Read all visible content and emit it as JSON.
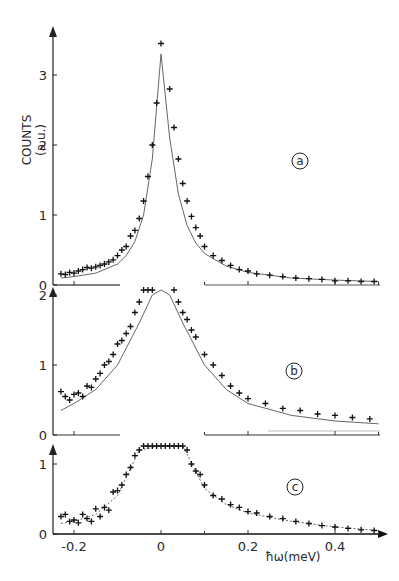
{
  "chart_data": {
    "type": "scatter",
    "title": "",
    "xlabel": "ħω(meV)",
    "ylabel": "COUNTS (a.u.)",
    "xlim": [
      -0.24,
      0.5
    ],
    "x_ticks": [
      "-0.2",
      "0",
      "0.2",
      "0.4"
    ],
    "x_tick_values": [
      -0.2,
      0,
      0.2,
      0.4
    ],
    "panels": [
      {
        "label": "a",
        "ylim": [
          0,
          3.5
        ],
        "y_ticks": [
          "0",
          "1",
          "2",
          "3"
        ],
        "y_tick_values": [
          0,
          1,
          2,
          3
        ],
        "series": [
          {
            "name": "data",
            "style": "plus-markers",
            "x": [
              -0.23,
              -0.22,
              -0.21,
              -0.2,
              -0.19,
              -0.18,
              -0.17,
              -0.16,
              -0.15,
              -0.14,
              -0.13,
              -0.12,
              -0.11,
              -0.1,
              -0.09,
              -0.08,
              -0.07,
              -0.06,
              -0.05,
              -0.04,
              -0.03,
              -0.02,
              -0.01,
              0.0,
              0.02,
              0.03,
              0.04,
              0.05,
              0.06,
              0.07,
              0.08,
              0.09,
              0.1,
              0.12,
              0.14,
              0.16,
              0.18,
              0.2,
              0.22,
              0.25,
              0.28,
              0.31,
              0.34,
              0.37,
              0.4,
              0.43,
              0.46,
              0.49
            ],
            "y": [
              0.16,
              0.15,
              0.18,
              0.17,
              0.2,
              0.22,
              0.25,
              0.24,
              0.26,
              0.28,
              0.3,
              0.33,
              0.36,
              0.42,
              0.5,
              0.55,
              0.7,
              0.78,
              0.95,
              1.2,
              1.55,
              2.0,
              2.6,
              3.45,
              2.8,
              2.25,
              1.8,
              1.45,
              1.2,
              0.98,
              0.82,
              0.7,
              0.55,
              0.42,
              0.35,
              0.28,
              0.22,
              0.2,
              0.16,
              0.14,
              0.12,
              0.1,
              0.09,
              0.08,
              0.06,
              0.06,
              0.05,
              0.05
            ]
          },
          {
            "name": "fit",
            "style": "solid-line",
            "x": [
              -0.23,
              -0.2,
              -0.15,
              -0.1,
              -0.08,
              -0.06,
              -0.04,
              -0.02,
              0.0,
              0.02,
              0.04,
              0.06,
              0.08,
              0.1,
              0.15,
              0.2,
              0.3,
              0.4,
              0.5
            ],
            "y": [
              0.1,
              0.12,
              0.17,
              0.3,
              0.42,
              0.62,
              1.0,
              1.8,
              3.3,
              2.1,
              1.3,
              0.85,
              0.6,
              0.45,
              0.27,
              0.18,
              0.1,
              0.07,
              0.05
            ]
          }
        ]
      },
      {
        "label": "b",
        "ylim": [
          0,
          2
        ],
        "y_ticks": [
          "0",
          "1",
          "2"
        ],
        "y_tick_values": [
          0,
          1,
          2
        ],
        "series": [
          {
            "name": "data",
            "style": "plus-markers",
            "x": [
              -0.23,
              -0.22,
              -0.21,
              -0.2,
              -0.19,
              -0.18,
              -0.17,
              -0.16,
              -0.15,
              -0.14,
              -0.13,
              -0.12,
              -0.11,
              -0.1,
              -0.09,
              -0.08,
              -0.07,
              -0.06,
              -0.05,
              -0.04,
              -0.03,
              -0.02,
              0.03,
              0.04,
              0.05,
              0.06,
              0.07,
              0.08,
              0.1,
              0.12,
              0.14,
              0.16,
              0.18,
              0.2,
              0.24,
              0.28,
              0.32,
              0.36,
              0.4,
              0.44,
              0.48
            ],
            "y": [
              0.62,
              0.55,
              0.5,
              0.58,
              0.6,
              0.55,
              0.7,
              0.68,
              0.8,
              0.88,
              1.0,
              1.05,
              1.15,
              1.3,
              1.35,
              1.45,
              1.55,
              1.75,
              1.9,
              2.2,
              2.4,
              2.5,
              2.1,
              1.9,
              1.75,
              1.65,
              1.5,
              1.4,
              1.15,
              1.0,
              0.85,
              0.7,
              0.6,
              0.52,
              0.45,
              0.38,
              0.35,
              0.3,
              0.28,
              0.25,
              0.23
            ]
          },
          {
            "name": "fit",
            "style": "solid-line",
            "x": [
              -0.23,
              -0.2,
              -0.15,
              -0.1,
              -0.05,
              -0.02,
              0.0,
              0.02,
              0.05,
              0.1,
              0.15,
              0.2,
              0.3,
              0.4,
              0.5
            ],
            "y": [
              0.35,
              0.45,
              0.65,
              1.0,
              1.6,
              2.0,
              2.1,
              2.0,
              1.6,
              1.0,
              0.65,
              0.45,
              0.28,
              0.2,
              0.16
            ]
          }
        ]
      },
      {
        "label": "c",
        "ylim": [
          0,
          1.3
        ],
        "y_ticks": [
          "0",
          "1"
        ],
        "y_tick_values": [
          0,
          1
        ],
        "series": [
          {
            "name": "data",
            "style": "plus-markers",
            "x": [
              -0.23,
              -0.22,
              -0.21,
              -0.2,
              -0.19,
              -0.18,
              -0.17,
              -0.16,
              -0.15,
              -0.14,
              -0.13,
              -0.12,
              -0.11,
              -0.1,
              -0.09,
              -0.08,
              -0.07,
              -0.06,
              -0.05,
              -0.04,
              -0.03,
              -0.02,
              -0.01,
              0.0,
              0.01,
              0.02,
              0.03,
              0.04,
              0.05,
              0.06,
              0.07,
              0.08,
              0.09,
              0.1,
              0.12,
              0.14,
              0.16,
              0.18,
              0.2,
              0.22,
              0.25,
              0.28,
              0.31,
              0.34,
              0.37,
              0.4,
              0.43,
              0.46,
              0.49
            ],
            "y": [
              0.25,
              0.28,
              0.18,
              0.2,
              0.16,
              0.28,
              0.22,
              0.18,
              0.36,
              0.25,
              0.38,
              0.34,
              0.6,
              0.62,
              0.7,
              0.85,
              0.95,
              1.12,
              1.2,
              1.5,
              1.75,
              1.95,
              2.2,
              2.3,
              2.1,
              1.9,
              1.75,
              1.6,
              1.4,
              1.2,
              1.0,
              0.9,
              0.85,
              0.7,
              0.55,
              0.5,
              0.42,
              0.38,
              0.32,
              0.3,
              0.25,
              0.22,
              0.18,
              0.15,
              0.12,
              0.1,
              0.08,
              0.06,
              0.05
            ]
          },
          {
            "name": "fit",
            "style": "dotted-line",
            "x": [
              -0.23,
              -0.2,
              -0.15,
              -0.1,
              -0.05,
              0.0,
              0.05,
              0.1,
              0.15,
              0.2,
              0.3,
              0.4,
              0.5
            ],
            "y": [
              0.15,
              0.18,
              0.28,
              0.55,
              1.2,
              2.2,
              1.3,
              0.65,
              0.42,
              0.3,
              0.18,
              0.1,
              0.05
            ]
          }
        ]
      }
    ],
    "legend": [],
    "annotations": [
      "a",
      "b",
      "c"
    ],
    "grid": false
  },
  "figure": {
    "y_axis_title_line1": "COUNTS",
    "y_axis_title_line2": "(a.u.)",
    "x_axis_title": "ħω(meV)",
    "panel_a_label": "a",
    "panel_b_label": "b",
    "panel_c_label": "c",
    "x_tick_labels": [
      "-0.2",
      "0",
      "0.2",
      "0.4"
    ],
    "panel_a_y_ticks": [
      "0",
      "1",
      "2",
      "3"
    ],
    "panel_b_y_ticks": [
      "0",
      "1",
      "2"
    ],
    "panel_c_y_ticks": [
      "0",
      "1"
    ]
  }
}
